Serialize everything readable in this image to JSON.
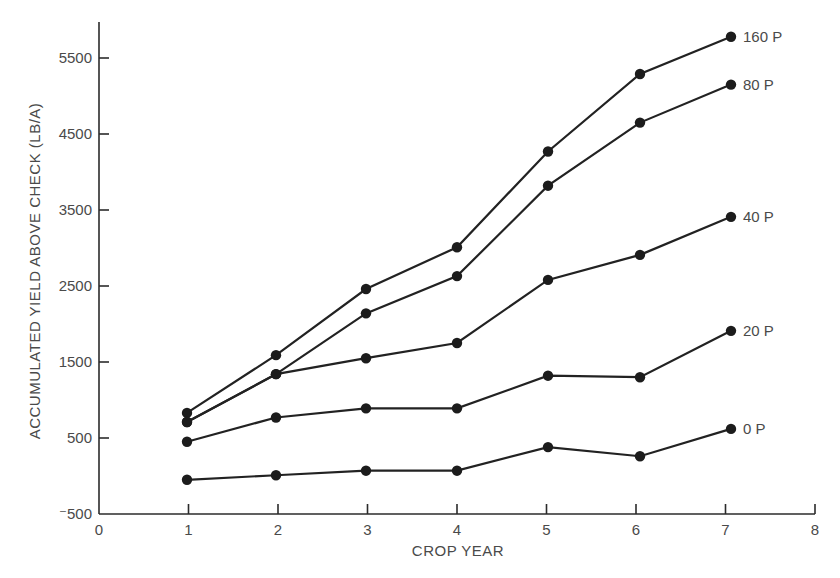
{
  "chart_data": {
    "type": "line",
    "title": "",
    "xlabel": "CROP YEAR",
    "ylabel": "ACCUMULATED YIELD ABOVE CHECK (LB/A)",
    "xlim": [
      0,
      8
    ],
    "ylim": [
      -500,
      6000
    ],
    "x_ticks": [
      0,
      1,
      2,
      3,
      4,
      5,
      6,
      7,
      8
    ],
    "x_tick_labels": [
      "0",
      "1",
      "2",
      "3",
      "4",
      "5",
      "6",
      "7",
      "8"
    ],
    "y_ticks": [
      -500,
      500,
      1500,
      2500,
      3500,
      4500,
      5500
    ],
    "y_tick_labels": [
      "⁻500",
      "500",
      "1500",
      "2500",
      "3500",
      "4500",
      "5500"
    ],
    "grid": false,
    "legend": "inline labels at right end of each series",
    "x": [
      1,
      2,
      3,
      4,
      5,
      6,
      7
    ],
    "series": [
      {
        "name": "160 P",
        "values": [
          830,
          1590,
          2460,
          3010,
          4270,
          5290,
          5780
        ]
      },
      {
        "name": "80 P",
        "values": [
          710,
          1340,
          2140,
          2630,
          3820,
          4650,
          5150
        ]
      },
      {
        "name": "40 P",
        "values": [
          710,
          1340,
          1550,
          1750,
          2580,
          2910,
          3410
        ]
      },
      {
        "name": "20 P",
        "values": [
          450,
          770,
          890,
          890,
          1320,
          1300,
          1910
        ]
      },
      {
        "name": "0 P",
        "values": [
          -50,
          10,
          70,
          70,
          380,
          260,
          620
        ]
      }
    ]
  },
  "layout": {
    "plot_x_px": [
      187,
      276,
      366,
      457,
      548,
      640,
      731
    ],
    "colors": {
      "line": "#222222",
      "axis": "#2b2b2b",
      "text": "#4a4a4a"
    }
  }
}
